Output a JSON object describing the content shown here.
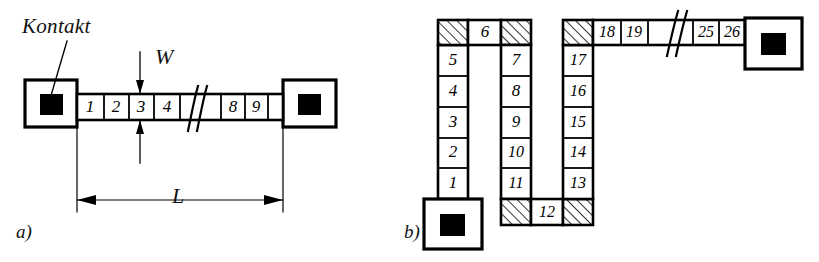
{
  "figure": {
    "caption_a": "a)",
    "caption_b": "b)",
    "contact_label": "Kontakt",
    "dim_length": "L",
    "dim_width": "W"
  },
  "part_a": {
    "label": "a)",
    "annotation": "Kontakt",
    "dimension_length": "L",
    "dimension_width": "W",
    "left_contact": "contact-pad",
    "right_contact": "contact-pad",
    "break_symbol": "//",
    "cells_left": [
      "1",
      "2",
      "3",
      "4"
    ],
    "cells_right": [
      "8",
      "9"
    ]
  },
  "part_b": {
    "label": "b)",
    "break_symbol": "//",
    "bottom_contact": "contact-pad",
    "right_contact": "contact-pad",
    "column_1": [
      "5",
      "4",
      "3",
      "2",
      "1"
    ],
    "column_2": [
      "7",
      "8",
      "9",
      "10",
      "11"
    ],
    "column_3": [
      "17",
      "16",
      "15",
      "14",
      "13"
    ],
    "corner_top_1": "6",
    "corner_bottom_2": "12",
    "top_strip_left": [
      "18",
      "19"
    ],
    "top_strip_right": [
      "25",
      "26"
    ],
    "hatched_corners": 6
  },
  "colors": {
    "stroke": "#000000",
    "fill": "#ffffff",
    "pad_center": "#000000",
    "background": "#ffffff"
  }
}
